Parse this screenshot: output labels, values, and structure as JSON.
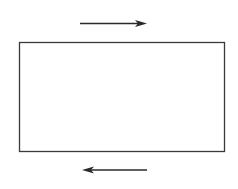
{
  "diagram": {
    "colors": {
      "background": "#ffffff",
      "stroke": "#3a3a3a"
    },
    "rectangle": {
      "x": 19,
      "y": 42,
      "width": 205,
      "height": 109
    },
    "arrows": [
      {
        "name": "top-arrow",
        "direction": "right",
        "x1": 80,
        "y1": 23.5,
        "x2": 147,
        "y2": 23.5
      },
      {
        "name": "bottom-arrow",
        "direction": "left",
        "x1": 147,
        "y1": 170,
        "x2": 82,
        "y2": 170
      }
    ]
  }
}
